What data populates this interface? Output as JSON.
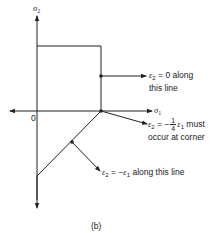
{
  "axes": {
    "vertical_label": "σ",
    "vertical_label_sub": "2",
    "horizontal_label": "σ",
    "horizontal_label_sub": "1",
    "origin_label": "0"
  },
  "annotations": {
    "top": {
      "line1_prefix": "ε",
      "line1_sub": "2",
      "line1_rest": " = 0 along",
      "line2": "this line"
    },
    "corner": {
      "line1_prefix": "ε",
      "line1_sub": "2",
      "line1_eq": " = −",
      "frac_num": "1",
      "frac_den": "4",
      "line1_var": "ε",
      "line1_var_sub": "1",
      "line1_rest": " must",
      "line2": "occur at corner"
    },
    "bottom": {
      "prefix": "ε",
      "sub": "2",
      "eq": " = −",
      "var": "ε",
      "var_sub": "1",
      "rest": " along this line"
    }
  },
  "caption": "(b)",
  "colors": {
    "line": "#222222",
    "background": "#ffffff"
  }
}
